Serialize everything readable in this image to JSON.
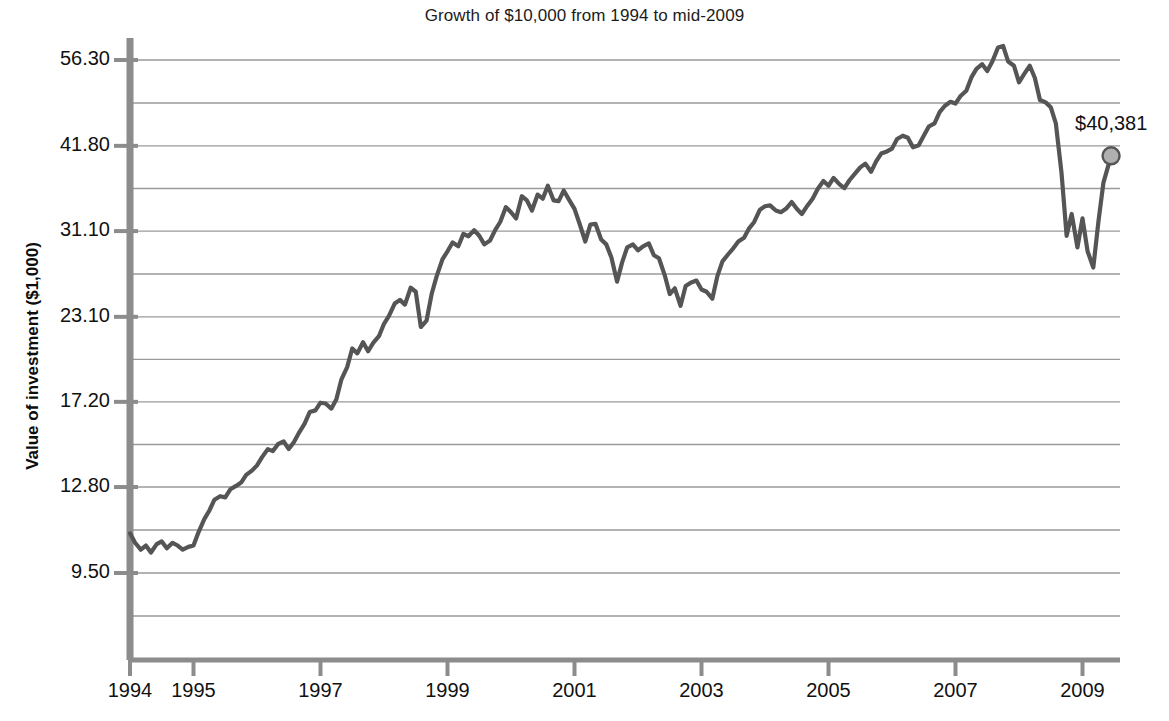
{
  "chart_data": {
    "type": "line",
    "title": "Growth of $10,000 from 1994 to mid-2009",
    "xlabel": "",
    "ylabel": "Value of investment ($1,000)",
    "yscale": "log",
    "ylim": [
      8.6,
      62.0
    ],
    "xlim": [
      1994.0,
      2009.5
    ],
    "grid": true,
    "legend": false,
    "y_tick_labels": [
      "56.30",
      "41.80",
      "31.10",
      "23.10",
      "17.20",
      "12.80",
      "9.50"
    ],
    "y_tick_values": [
      56.3,
      41.8,
      31.1,
      23.1,
      17.2,
      12.8,
      9.5
    ],
    "x_tick_labels": [
      "1994",
      "1995",
      "1997",
      "1999",
      "2001",
      "2003",
      "2005",
      "2007",
      "2009"
    ],
    "x_tick_values": [
      1994,
      1995,
      1997,
      1999,
      2001,
      2003,
      2005,
      2007,
      2009
    ],
    "annotations": [
      {
        "name": "end-value",
        "text": "$40,381",
        "x": 2009.45,
        "y": 40.381,
        "marker": "circle"
      }
    ],
    "colors": {
      "line": "#555555",
      "grid": "#9a9a9a",
      "axis": "#8c8c8c",
      "marker_fill": "#b0b0b0",
      "marker_stroke": "#555555",
      "text": "#111111",
      "background": "#ffffff"
    },
    "series": [
      {
        "name": "Value of investment",
        "x": [
          1994.0,
          1994.08,
          1994.17,
          1994.25,
          1994.33,
          1994.42,
          1994.5,
          1994.58,
          1994.67,
          1994.75,
          1994.83,
          1994.92,
          1995.0,
          1995.08,
          1995.17,
          1995.25,
          1995.33,
          1995.42,
          1995.5,
          1995.58,
          1995.67,
          1995.75,
          1995.83,
          1995.92,
          1996.0,
          1996.08,
          1996.17,
          1996.25,
          1996.33,
          1996.42,
          1996.5,
          1996.58,
          1996.67,
          1996.75,
          1996.83,
          1996.92,
          1997.0,
          1997.08,
          1997.17,
          1997.25,
          1997.33,
          1997.42,
          1997.5,
          1997.58,
          1997.67,
          1997.75,
          1997.83,
          1997.92,
          1998.0,
          1998.08,
          1998.17,
          1998.25,
          1998.33,
          1998.42,
          1998.5,
          1998.58,
          1998.67,
          1998.75,
          1998.83,
          1998.92,
          1999.0,
          1999.08,
          1999.17,
          1999.25,
          1999.33,
          1999.42,
          1999.5,
          1999.58,
          1999.67,
          1999.75,
          1999.83,
          1999.92,
          2000.0,
          2000.08,
          2000.17,
          2000.25,
          2000.33,
          2000.42,
          2000.5,
          2000.58,
          2000.67,
          2000.75,
          2000.83,
          2000.92,
          2001.0,
          2001.08,
          2001.17,
          2001.25,
          2001.33,
          2001.42,
          2001.5,
          2001.58,
          2001.67,
          2001.75,
          2001.83,
          2001.92,
          2002.0,
          2002.08,
          2002.17,
          2002.25,
          2002.33,
          2002.42,
          2002.5,
          2002.58,
          2002.67,
          2002.75,
          2002.83,
          2002.92,
          2003.0,
          2003.08,
          2003.17,
          2003.25,
          2003.33,
          2003.42,
          2003.5,
          2003.58,
          2003.67,
          2003.75,
          2003.83,
          2003.92,
          2004.0,
          2004.08,
          2004.17,
          2004.25,
          2004.33,
          2004.42,
          2004.5,
          2004.58,
          2004.67,
          2004.75,
          2004.83,
          2004.92,
          2005.0,
          2005.08,
          2005.17,
          2005.25,
          2005.33,
          2005.42,
          2005.5,
          2005.58,
          2005.67,
          2005.75,
          2005.83,
          2005.92,
          2006.0,
          2006.08,
          2006.17,
          2006.25,
          2006.33,
          2006.42,
          2006.5,
          2006.58,
          2006.67,
          2006.75,
          2006.83,
          2006.92,
          2007.0,
          2007.08,
          2007.17,
          2007.25,
          2007.33,
          2007.42,
          2007.5,
          2007.58,
          2007.67,
          2007.75,
          2007.83,
          2007.92,
          2008.0,
          2008.08,
          2008.17,
          2008.25,
          2008.33,
          2008.42,
          2008.5,
          2008.58,
          2008.67,
          2008.75,
          2008.83,
          2008.92,
          2009.0,
          2009.08,
          2009.17,
          2009.25,
          2009.33,
          2009.45
        ],
        "values": [
          10.9,
          10.55,
          10.3,
          10.45,
          10.2,
          10.5,
          10.6,
          10.35,
          10.55,
          10.45,
          10.3,
          10.4,
          10.45,
          10.95,
          11.45,
          11.8,
          12.25,
          12.4,
          12.35,
          12.7,
          12.85,
          13.0,
          13.35,
          13.55,
          13.8,
          14.2,
          14.6,
          14.5,
          14.85,
          15.0,
          14.6,
          14.95,
          15.5,
          15.95,
          16.6,
          16.7,
          17.15,
          17.1,
          16.8,
          17.35,
          18.6,
          19.4,
          20.7,
          20.35,
          21.15,
          20.5,
          21.1,
          21.6,
          22.55,
          23.2,
          24.2,
          24.5,
          24.1,
          25.55,
          25.2,
          22.3,
          22.8,
          25.0,
          26.6,
          28.2,
          29.0,
          29.9,
          29.5,
          30.8,
          30.55,
          31.2,
          30.6,
          29.7,
          30.1,
          31.2,
          32.1,
          33.8,
          33.2,
          32.5,
          35.1,
          34.6,
          33.4,
          35.3,
          34.8,
          36.4,
          34.6,
          34.5,
          35.8,
          34.6,
          33.6,
          31.9,
          30.0,
          31.8,
          31.9,
          30.2,
          29.7,
          28.4,
          26.1,
          27.9,
          29.4,
          29.7,
          29.1,
          29.5,
          29.8,
          28.6,
          28.3,
          26.7,
          25.0,
          25.5,
          24.0,
          25.7,
          26.0,
          26.2,
          25.4,
          25.2,
          24.6,
          26.6,
          28.0,
          28.7,
          29.3,
          30.0,
          30.4,
          31.4,
          32.1,
          33.5,
          33.9,
          34.0,
          33.4,
          33.2,
          33.6,
          34.4,
          33.6,
          33.0,
          34.0,
          34.8,
          36.0,
          37.0,
          36.4,
          37.4,
          36.6,
          36.1,
          37.1,
          38.0,
          38.8,
          39.3,
          38.2,
          39.6,
          40.7,
          41.0,
          41.4,
          42.8,
          43.3,
          43.0,
          41.6,
          41.9,
          43.3,
          44.7,
          45.2,
          47.0,
          48.0,
          48.7,
          48.4,
          49.7,
          50.6,
          53.0,
          54.6,
          55.5,
          54.2,
          56.0,
          58.8,
          59.1,
          56.0,
          55.2,
          52.1,
          53.6,
          55.2,
          52.9,
          49.0,
          48.6,
          47.8,
          45.2,
          38.0,
          30.6,
          33.0,
          29.4,
          32.5,
          29.0,
          27.4,
          32.1,
          36.8,
          40.381
        ]
      }
    ]
  }
}
